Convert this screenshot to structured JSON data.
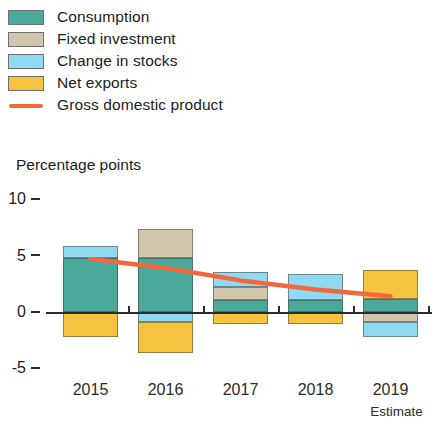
{
  "legend": {
    "items": [
      {
        "label": "Consumption",
        "color": "#4aa99b",
        "type": "swatch"
      },
      {
        "label": "Fixed investment",
        "color": "#cfc6ab",
        "type": "swatch"
      },
      {
        "label": "Change in stocks",
        "color": "#8fd9f2",
        "type": "swatch"
      },
      {
        "label": "Net exports",
        "color": "#f5c33f",
        "type": "swatch"
      },
      {
        "label": "Gross domestic product",
        "color": "#f2683c",
        "type": "line"
      }
    ]
  },
  "axis_title": "Percentage points",
  "footnote": "Estimate",
  "chart_data": {
    "type": "bar",
    "title": "",
    "subtitle": "",
    "xlabel": "",
    "ylabel": "Percentage points",
    "ylim": [
      -5,
      10
    ],
    "yticks": [
      10,
      5,
      0,
      -5
    ],
    "ytick_labels": [
      "10",
      "5",
      "0",
      "-5"
    ],
    "grid": false,
    "legend_position": "top-left",
    "stacked": true,
    "categories": [
      "2015",
      "2016",
      "2017",
      "2018",
      "2019"
    ],
    "series": [
      {
        "name": "Consumption",
        "color": "#4aa99b",
        "values": [
          4.75,
          4.75,
          1.05,
          1.05,
          1.15
        ]
      },
      {
        "name": "Fixed investment",
        "color": "#cfc6ab",
        "values": [
          0,
          2.65,
          1.15,
          0,
          -0.85
        ]
      },
      {
        "name": "Change in stocks",
        "color": "#8fd9f2",
        "values": [
          1.15,
          -0.85,
          1.35,
          2.35,
          -1.35
        ]
      },
      {
        "name": "Net exports",
        "color": "#f5c33f",
        "values": [
          -2.2,
          -2.8,
          -1.05,
          -1.05,
          2.55
        ]
      }
    ],
    "line_series": {
      "name": "Gross domestic product",
      "color": "#f2683c",
      "x": [
        "2015",
        "2016",
        "2017",
        "2018",
        "2019"
      ],
      "values": [
        4.7,
        3.9,
        2.8,
        2.0,
        1.4
      ]
    },
    "annotations": [
      {
        "text": "Estimate",
        "x": "2019",
        "position": "below-axis"
      }
    ]
  }
}
